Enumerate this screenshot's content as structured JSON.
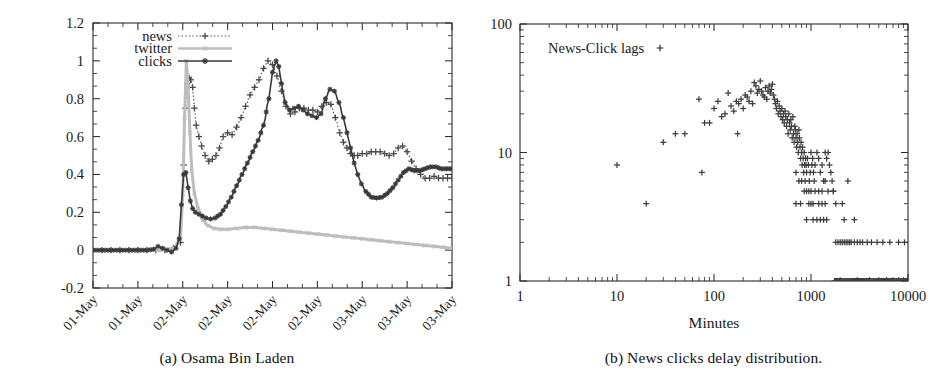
{
  "figure": {
    "panels": [
      {
        "id": "panel-a",
        "caption": "(a) Osama Bin Laden",
        "chart_index": 0
      },
      {
        "id": "panel-b",
        "caption": "(b) News clicks delay distribution.",
        "chart_index": 1
      }
    ]
  },
  "colors": {
    "news": "#4a4a4a",
    "twitter": "#bdbdbd",
    "clicks": "#3a3a3a",
    "axis": "#2b2b2b",
    "text": "#1a1a1a",
    "scatter": "#3d3d3d",
    "background": "#ffffff"
  },
  "chart_data": [
    {
      "type": "line",
      "title": "",
      "subtitle": "",
      "xlabel": "",
      "ylabel": "",
      "grid": false,
      "legend_position": "top-left",
      "ylim": [
        -0.2,
        1.2
      ],
      "yticks": [
        "-0.2",
        "0",
        "0.2",
        "0.4",
        "0.6",
        "0.8",
        "1",
        "1.2"
      ],
      "ytick_values": [
        -0.2,
        0,
        0.2,
        0.4,
        0.6,
        0.8,
        1.0,
        1.2
      ],
      "y_minor_per_major": 2,
      "xtick_labels": [
        "01-May",
        "01-May",
        "02-May",
        "02-May",
        "02-May",
        "02-May",
        "03-May",
        "03-May",
        "03-May"
      ],
      "x_minor_per_major": 2,
      "xlim": [
        0,
        8
      ],
      "x_axis_kind": "datetime-categorical",
      "series": [
        {
          "name": "news",
          "style": "dotted-with-plus",
          "marker": "+",
          "color": "#4a4a4a",
          "x": [
            0,
            0.2,
            0.4,
            0.6,
            0.8,
            1.0,
            1.2,
            1.4,
            1.6,
            1.8,
            1.95,
            2.02,
            2.06,
            2.1,
            2.14,
            2.18,
            2.22,
            2.26,
            2.3,
            2.36,
            2.42,
            2.5,
            2.58,
            2.66,
            2.74,
            2.82,
            2.9,
            3.0,
            3.1,
            3.2,
            3.3,
            3.4,
            3.5,
            3.6,
            3.7,
            3.8,
            3.9,
            4.0,
            4.1,
            4.2,
            4.3,
            4.4,
            4.5,
            4.6,
            4.7,
            4.8,
            4.9,
            5.0,
            5.1,
            5.2,
            5.3,
            5.4,
            5.5,
            5.58,
            5.66,
            5.74,
            5.82,
            5.9,
            6.0,
            6.1,
            6.2,
            6.3,
            6.4,
            6.5,
            6.6,
            6.7,
            6.8,
            6.9,
            7.0,
            7.1,
            7.2,
            7.3,
            7.4,
            7.5,
            7.6,
            7.7,
            7.8,
            7.9,
            8.0
          ],
          "y": [
            0,
            0,
            0,
            0,
            0,
            0,
            0,
            0,
            0,
            0.01,
            0.04,
            0.45,
            0.75,
            0.88,
            0.91,
            0.9,
            0.86,
            0.75,
            0.66,
            0.6,
            0.55,
            0.5,
            0.47,
            0.48,
            0.5,
            0.54,
            0.6,
            0.62,
            0.61,
            0.65,
            0.7,
            0.76,
            0.82,
            0.86,
            0.9,
            0.96,
            1.0,
            0.98,
            0.92,
            0.84,
            0.76,
            0.72,
            0.73,
            0.75,
            0.75,
            0.74,
            0.74,
            0.73,
            0.76,
            0.78,
            0.77,
            0.7,
            0.62,
            0.57,
            0.54,
            0.51,
            0.5,
            0.5,
            0.51,
            0.51,
            0.52,
            0.52,
            0.52,
            0.51,
            0.5,
            0.51,
            0.54,
            0.55,
            0.52,
            0.47,
            0.43,
            0.4,
            0.38,
            0.38,
            0.39,
            0.38,
            0.38,
            0.38,
            0.38
          ]
        },
        {
          "name": "twitter",
          "style": "light-dotted",
          "marker": "x",
          "color": "#bdbdbd",
          "x": [
            0,
            0.3,
            0.6,
            0.9,
            1.2,
            1.5,
            1.8,
            1.95,
            2.0,
            2.04,
            2.08,
            2.12,
            2.16,
            2.2,
            2.26,
            2.34,
            2.44,
            2.56,
            2.7,
            2.85,
            3.0,
            3.2,
            3.4,
            3.6,
            3.8,
            4.0,
            4.2,
            4.4,
            4.6,
            4.8,
            5.0,
            5.2,
            5.4,
            5.6,
            5.8,
            6.0,
            6.2,
            6.4,
            6.6,
            6.8,
            7.0,
            7.2,
            7.4,
            7.6,
            7.8,
            8.0
          ],
          "y": [
            0,
            0,
            0,
            0,
            0,
            0,
            0.01,
            0.06,
            0.3,
            0.7,
            1.0,
            0.86,
            0.62,
            0.42,
            0.3,
            0.22,
            0.16,
            0.13,
            0.115,
            0.11,
            0.11,
            0.115,
            0.12,
            0.12,
            0.115,
            0.11,
            0.105,
            0.1,
            0.095,
            0.09,
            0.085,
            0.08,
            0.075,
            0.07,
            0.065,
            0.06,
            0.055,
            0.05,
            0.045,
            0.04,
            0.035,
            0.03,
            0.025,
            0.02,
            0.015,
            0.01
          ]
        },
        {
          "name": "clicks",
          "style": "solid-with-star",
          "marker": "✱",
          "color": "#3a3a3a",
          "x": [
            0,
            0.2,
            0.4,
            0.6,
            0.8,
            1.0,
            1.2,
            1.35,
            1.45,
            1.55,
            1.65,
            1.75,
            1.85,
            1.92,
            1.97,
            2.02,
            2.07,
            2.12,
            2.17,
            2.22,
            2.28,
            2.36,
            2.44,
            2.52,
            2.62,
            2.72,
            2.84,
            2.96,
            3.08,
            3.2,
            3.32,
            3.44,
            3.56,
            3.68,
            3.8,
            3.92,
            4.0,
            4.08,
            4.14,
            4.2,
            4.28,
            4.38,
            4.48,
            4.58,
            4.68,
            4.78,
            4.88,
            4.98,
            5.08,
            5.18,
            5.28,
            5.38,
            5.48,
            5.58,
            5.66,
            5.74,
            5.82,
            5.9,
            5.98,
            6.08,
            6.2,
            6.32,
            6.44,
            6.56,
            6.68,
            6.8,
            6.92,
            7.04,
            7.16,
            7.28,
            7.4,
            7.52,
            7.64,
            7.76,
            7.88,
            8.0
          ],
          "y": [
            0,
            0,
            0,
            0,
            0,
            0,
            0,
            0.005,
            0.02,
            0.01,
            0,
            -0.01,
            0.01,
            0.06,
            0.24,
            0.4,
            0.41,
            0.33,
            0.26,
            0.22,
            0.2,
            0.19,
            0.18,
            0.17,
            0.165,
            0.17,
            0.19,
            0.23,
            0.28,
            0.34,
            0.4,
            0.46,
            0.52,
            0.58,
            0.66,
            0.8,
            0.94,
            1.0,
            0.97,
            0.88,
            0.78,
            0.74,
            0.75,
            0.76,
            0.74,
            0.72,
            0.71,
            0.7,
            0.72,
            0.8,
            0.85,
            0.84,
            0.78,
            0.7,
            0.62,
            0.54,
            0.46,
            0.4,
            0.35,
            0.31,
            0.28,
            0.275,
            0.28,
            0.3,
            0.33,
            0.37,
            0.41,
            0.43,
            0.42,
            0.42,
            0.43,
            0.44,
            0.44,
            0.43,
            0.43,
            0.43
          ]
        }
      ]
    },
    {
      "type": "scatter",
      "title": "",
      "annotation": "News-Click lags",
      "annotation_marker": "+",
      "xlabel": "Minutes",
      "ylabel": "",
      "grid": false,
      "xscale": "log",
      "yscale": "log",
      "xlim": [
        1,
        10000
      ],
      "ylim": [
        1,
        100
      ],
      "xticks": [
        "1",
        "10",
        "100",
        "1000",
        "10000"
      ],
      "xtick_values": [
        1,
        10,
        100,
        1000,
        10000
      ],
      "yticks": [
        "1",
        "10",
        "100"
      ],
      "ytick_values": [
        1,
        10,
        100
      ],
      "marker": "+",
      "color": "#3d3d3d",
      "points": [
        [
          10,
          8
        ],
        [
          20,
          4
        ],
        [
          30,
          12
        ],
        [
          40,
          14
        ],
        [
          50,
          14
        ],
        [
          70,
          26
        ],
        [
          75,
          7
        ],
        [
          80,
          17
        ],
        [
          90,
          17
        ],
        [
          100,
          22
        ],
        [
          110,
          25
        ],
        [
          120,
          19
        ],
        [
          130,
          20
        ],
        [
          140,
          29
        ],
        [
          150,
          23
        ],
        [
          160,
          21
        ],
        [
          170,
          25
        ],
        [
          175,
          14
        ],
        [
          180,
          24
        ],
        [
          190,
          26
        ],
        [
          200,
          22
        ],
        [
          210,
          28
        ],
        [
          220,
          27
        ],
        [
          230,
          25
        ],
        [
          240,
          30
        ],
        [
          250,
          24
        ],
        [
          260,
          35
        ],
        [
          270,
          33
        ],
        [
          280,
          29
        ],
        [
          290,
          31
        ],
        [
          300,
          36
        ],
        [
          310,
          30
        ],
        [
          320,
          28
        ],
        [
          330,
          27
        ],
        [
          340,
          32
        ],
        [
          350,
          26
        ],
        [
          360,
          30
        ],
        [
          370,
          33
        ],
        [
          380,
          29
        ],
        [
          390,
          31
        ],
        [
          400,
          34
        ],
        [
          410,
          28
        ],
        [
          420,
          26
        ],
        [
          430,
          24
        ],
        [
          440,
          22
        ],
        [
          450,
          25
        ],
        [
          460,
          20
        ],
        [
          470,
          23
        ],
        [
          480,
          21
        ],
        [
          490,
          19
        ],
        [
          500,
          22
        ],
        [
          510,
          18
        ],
        [
          520,
          20
        ],
        [
          530,
          17
        ],
        [
          540,
          21
        ],
        [
          550,
          19
        ],
        [
          560,
          16
        ],
        [
          570,
          18
        ],
        [
          580,
          14
        ],
        [
          590,
          20
        ],
        [
          600,
          17
        ],
        [
          610,
          15
        ],
        [
          620,
          18
        ],
        [
          630,
          16
        ],
        [
          640,
          13
        ],
        [
          650,
          19
        ],
        [
          660,
          14
        ],
        [
          670,
          12
        ],
        [
          680,
          16
        ],
        [
          690,
          15
        ],
        [
          700,
          13
        ],
        [
          710,
          11
        ],
        [
          720,
          14
        ],
        [
          730,
          12
        ],
        [
          740,
          10
        ],
        [
          750,
          15
        ],
        [
          760,
          13
        ],
        [
          770,
          11
        ],
        [
          780,
          9
        ],
        [
          790,
          12
        ],
        [
          800,
          10
        ],
        [
          810,
          8
        ],
        [
          820,
          11
        ],
        [
          830,
          9
        ],
        [
          840,
          7
        ],
        [
          850,
          10
        ],
        [
          860,
          8
        ],
        [
          870,
          6
        ],
        [
          880,
          9
        ],
        [
          890,
          8
        ],
        [
          900,
          7
        ],
        [
          920,
          9
        ],
        [
          940,
          8
        ],
        [
          960,
          6
        ],
        [
          980,
          7
        ],
        [
          1000,
          10
        ],
        [
          1020,
          8
        ],
        [
          1040,
          9
        ],
        [
          1060,
          7
        ],
        [
          1080,
          6
        ],
        [
          1100,
          8
        ],
        [
          1150,
          10
        ],
        [
          1200,
          9
        ],
        [
          1250,
          7
        ],
        [
          1300,
          8
        ],
        [
          1350,
          6
        ],
        [
          1400,
          10
        ],
        [
          1450,
          9
        ],
        [
          1500,
          10
        ],
        [
          1550,
          8
        ],
        [
          1600,
          7
        ],
        [
          1650,
          6
        ],
        [
          1700,
          5
        ],
        [
          700,
          7
        ],
        [
          750,
          6
        ],
        [
          800,
          6
        ],
        [
          850,
          5
        ],
        [
          900,
          5
        ],
        [
          950,
          5
        ],
        [
          1000,
          5
        ],
        [
          1100,
          5
        ],
        [
          1200,
          5
        ],
        [
          1300,
          5
        ],
        [
          700,
          4
        ],
        [
          780,
          4
        ],
        [
          950,
          4
        ],
        [
          1000,
          4
        ],
        [
          1050,
          4
        ],
        [
          1200,
          4
        ],
        [
          1300,
          4
        ],
        [
          1400,
          4
        ],
        [
          1800,
          4
        ],
        [
          2100,
          4
        ],
        [
          900,
          3
        ],
        [
          1050,
          3
        ],
        [
          1150,
          3
        ],
        [
          1250,
          3
        ],
        [
          1350,
          3
        ],
        [
          1450,
          3
        ],
        [
          2200,
          3
        ],
        [
          2800,
          3
        ],
        [
          1400,
          6
        ],
        [
          2400,
          6
        ],
        [
          1500,
          5
        ],
        [
          1700,
          5
        ],
        [
          1800,
          2
        ],
        [
          1900,
          2
        ],
        [
          2000,
          2
        ],
        [
          2100,
          2
        ],
        [
          2200,
          2
        ],
        [
          2300,
          2
        ],
        [
          2400,
          2
        ],
        [
          2500,
          2
        ],
        [
          2600,
          2
        ],
        [
          2800,
          2
        ],
        [
          3000,
          2
        ],
        [
          3200,
          2
        ],
        [
          3400,
          2
        ],
        [
          3800,
          2
        ],
        [
          4200,
          2
        ],
        [
          4800,
          2
        ],
        [
          5500,
          2
        ],
        [
          6500,
          2
        ],
        [
          8000,
          2
        ],
        [
          9200,
          2
        ],
        [
          1800,
          1
        ],
        [
          1950,
          1
        ],
        [
          2100,
          1
        ],
        [
          2250,
          1
        ],
        [
          2400,
          1
        ],
        [
          2550,
          1
        ],
        [
          2700,
          1
        ],
        [
          2900,
          1
        ],
        [
          3100,
          1
        ],
        [
          3300,
          1
        ],
        [
          3500,
          1
        ],
        [
          3700,
          1
        ],
        [
          3900,
          1
        ],
        [
          4100,
          1
        ],
        [
          4400,
          1
        ],
        [
          4700,
          1
        ],
        [
          5000,
          1
        ],
        [
          5300,
          1
        ],
        [
          5600,
          1
        ],
        [
          6000,
          1
        ],
        [
          6400,
          1
        ],
        [
          6800,
          1
        ],
        [
          7200,
          1
        ],
        [
          7600,
          1
        ],
        [
          8000,
          1
        ],
        [
          8500,
          1
        ],
        [
          9000,
          1
        ],
        [
          9500,
          1
        ],
        [
          9900,
          1
        ]
      ]
    }
  ],
  "legend": {
    "items": [
      {
        "label": "news",
        "key": "news"
      },
      {
        "label": "twitter",
        "key": "twitter"
      },
      {
        "label": "clicks",
        "key": "clicks"
      }
    ]
  }
}
